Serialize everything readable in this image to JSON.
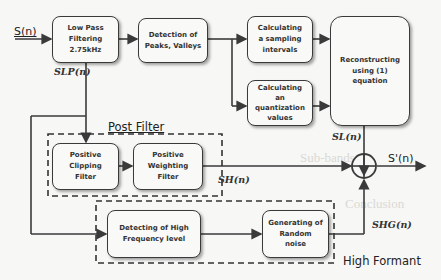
{
  "diagram": {
    "input_label": "S(n)",
    "output_label": "S'(n)",
    "blocks": {
      "low_pass": [
        "Low Pass",
        "Filtering",
        "2.75kHz"
      ],
      "detection": [
        "Detection of",
        "Peaks, Valleys"
      ],
      "calc_sampling": [
        "Calculating",
        "a sampling",
        "intervals"
      ],
      "calc_quant": [
        "Calculating",
        "an",
        "quantization",
        "values"
      ],
      "reconstruct": [
        "Reconstructing",
        "using (1)",
        "equation"
      ],
      "pos_clipping": [
        "Positive",
        "Clipping",
        "Filter"
      ],
      "pos_weighting": [
        "Positive",
        "Weighting",
        "Filter"
      ],
      "detect_high": [
        "Detecting of High",
        "Frequency level"
      ],
      "gen_noise": [
        "Generating of",
        "Random",
        "noise"
      ]
    },
    "signals": {
      "s_lp": "SLP(n)",
      "s_l": "SL(n)",
      "s_h": "SH(n)",
      "s_hg": "SHG(n)"
    },
    "regions": {
      "post_filter": "Post Filter",
      "high_formant": "High Formant"
    },
    "summing_junction": "+",
    "colors": {
      "line": "#3a3a3a",
      "background": "#f7f7f5",
      "box_fill": "#f9f9f7"
    }
  }
}
